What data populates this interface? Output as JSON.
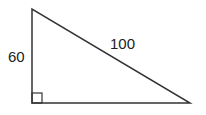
{
  "diagram": {
    "type": "right-triangle",
    "labels": {
      "vertical_leg": "60",
      "hypotenuse": "100"
    },
    "right_angle_marker": true,
    "colors": {
      "stroke": "#333333",
      "text": "#222222",
      "background": "#ffffff"
    }
  }
}
